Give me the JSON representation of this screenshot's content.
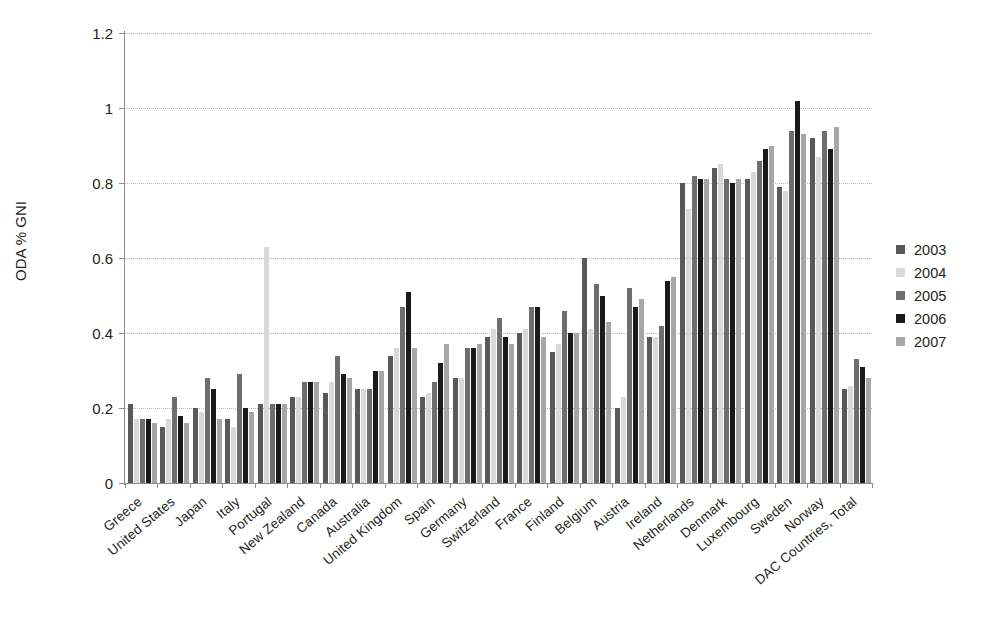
{
  "chart_data": {
    "type": "bar",
    "title": "",
    "subtitle": "",
    "xlabel": "",
    "ylabel": "ODA % GNI",
    "ylim": [
      0,
      1.2
    ],
    "yticks": [
      "0",
      "0.2",
      "0.4",
      "0.6",
      "0.8",
      "1",
      "1.2"
    ],
    "ytick_values": [
      0,
      0.2,
      0.4,
      0.6,
      0.8,
      1,
      1.2
    ],
    "grid": true,
    "legend_position": "right",
    "categories": [
      "Greece",
      "United States",
      "Japan",
      "Italy",
      "Portugal",
      "New Zealand",
      "Canada",
      "Australia",
      "United Kingdom",
      "Spain",
      "Germany",
      "Switzerland",
      "France",
      "Finland",
      "Belgium",
      "Austria",
      "Ireland",
      "Netherlands",
      "Denmark",
      "Luxembourg",
      "Sweden",
      "Norway",
      "DAC Countries, Total"
    ],
    "series": [
      {
        "name": "2003",
        "color": "#595959",
        "values": [
          0.21,
          0.15,
          0.2,
          0.17,
          0.21,
          0.23,
          0.24,
          0.25,
          0.34,
          0.23,
          0.28,
          0.39,
          0.4,
          0.35,
          0.6,
          0.2,
          0.39,
          0.8,
          0.84,
          0.81,
          0.79,
          0.92,
          0.25
        ]
      },
      {
        "name": "2004",
        "color": "#d9d9d9",
        "values": [
          0.17,
          0.17,
          0.19,
          0.15,
          0.63,
          0.23,
          0.27,
          0.25,
          0.36,
          0.24,
          0.28,
          0.41,
          0.41,
          0.37,
          0.41,
          0.23,
          0.39,
          0.73,
          0.85,
          0.83,
          0.78,
          0.87,
          0.26
        ]
      },
      {
        "name": "2005",
        "color": "#6e6e6e",
        "values": [
          0.17,
          0.23,
          0.28,
          0.29,
          0.21,
          0.27,
          0.34,
          0.25,
          0.47,
          0.27,
          0.36,
          0.44,
          0.47,
          0.46,
          0.53,
          0.52,
          0.42,
          0.82,
          0.81,
          0.86,
          0.94,
          0.94,
          0.33
        ]
      },
      {
        "name": "2006",
        "color": "#1a1a1a",
        "values": [
          0.17,
          0.18,
          0.25,
          0.2,
          0.21,
          0.27,
          0.29,
          0.3,
          0.51,
          0.32,
          0.36,
          0.39,
          0.47,
          0.4,
          0.5,
          0.47,
          0.54,
          0.81,
          0.8,
          0.89,
          1.02,
          0.89,
          0.31
        ]
      },
      {
        "name": "2007",
        "color": "#a6a6a6",
        "values": [
          0.16,
          0.16,
          0.17,
          0.19,
          0.21,
          0.27,
          0.28,
          0.3,
          0.36,
          0.37,
          0.37,
          0.37,
          0.39,
          0.4,
          0.43,
          0.49,
          0.55,
          0.81,
          0.81,
          0.9,
          0.93,
          0.95,
          0.28
        ]
      }
    ]
  },
  "legend": {
    "items": [
      {
        "label": "2003",
        "color": "#595959"
      },
      {
        "label": "2004",
        "color": "#d9d9d9"
      },
      {
        "label": "2005",
        "color": "#6e6e6e"
      },
      {
        "label": "2006",
        "color": "#1a1a1a"
      },
      {
        "label": "2007",
        "color": "#a6a6a6"
      }
    ]
  },
  "axes": {
    "y_title": "ODA % GNI"
  }
}
